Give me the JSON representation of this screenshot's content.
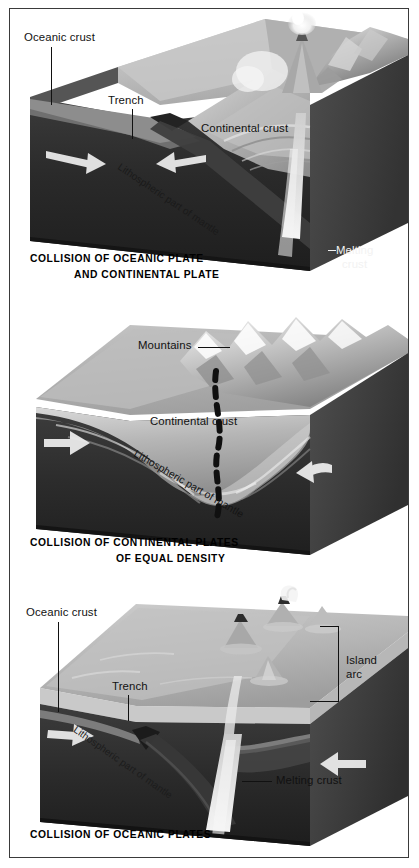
{
  "figure": {
    "medium": "grayscale textbook illustration",
    "panel_count": 3,
    "colors": {
      "frame": "#3a3a3a",
      "background": "#ffffff",
      "mantle_dark": "#2b2b2b",
      "mantle_mid": "#4a4a4a",
      "crust_light": "#c9c9c9",
      "crust_mid": "#9a9a9a",
      "ocean_water": "#b6b6b6",
      "magma": "#ededed",
      "label_text": "#111111",
      "label_text_white": "#f2f2f2"
    }
  },
  "panels": [
    {
      "id": "panel-1",
      "caption_line1": "COLLISION OF OCEANIC PLATE",
      "caption_line2": "AND CONTINENTAL PLATE",
      "labels": [
        {
          "name": "oceanic-crust",
          "text": "Oceanic crust",
          "color": "dark"
        },
        {
          "name": "trench",
          "text": "Trench",
          "color": "dark"
        },
        {
          "name": "continental-crust",
          "text": "Continental crust",
          "color": "dark"
        },
        {
          "name": "lithospheric-mantle",
          "text": "Lithospheric part of mantle",
          "color": "dark"
        },
        {
          "name": "melting-crust-line1",
          "text": "Melting",
          "color": "white"
        },
        {
          "name": "melting-crust-line2",
          "text": "crust",
          "color": "white"
        }
      ],
      "features": [
        "subducting oceanic slab",
        "deep ocean trench",
        "volcanic arc with eruption plume",
        "magma conduit",
        "folded continental crust"
      ]
    },
    {
      "id": "panel-2",
      "caption_line1": "COLLISION OF CONTINENTAL PLATES",
      "caption_line2": "OF EQUAL DENSITY",
      "labels": [
        {
          "name": "mountains",
          "text": "Mountains",
          "color": "dark"
        },
        {
          "name": "continental-crust",
          "text": "Continental  crust",
          "color": "dark"
        },
        {
          "name": "lithospheric-mantle",
          "text": "Lithospheric part of mantle",
          "color": "dark"
        }
      ],
      "features": [
        "uplifted mountain range",
        "dashed suture line",
        "thickened continental crust",
        "converging arrows"
      ]
    },
    {
      "id": "panel-3",
      "caption_line1": "COLLISION OF OCEANIC PLATES",
      "caption_line2": "",
      "labels": [
        {
          "name": "oceanic-crust",
          "text": "Oceanic crust",
          "color": "dark"
        },
        {
          "name": "trench",
          "text": "Trench",
          "color": "dark"
        },
        {
          "name": "island-arc-line1",
          "text": "Island",
          "color": "dark"
        },
        {
          "name": "island-arc-line2",
          "text": "arc",
          "color": "dark"
        },
        {
          "name": "melting-crust",
          "text": "Melting crust",
          "color": "dark"
        },
        {
          "name": "lithospheric-mantle",
          "text": "Lithospheric part of mantle",
          "color": "dark"
        }
      ],
      "features": [
        "subducting oceanic slab",
        "trench",
        "island arc volcanoes",
        "rising magma plume",
        "eruption plume"
      ]
    }
  ]
}
